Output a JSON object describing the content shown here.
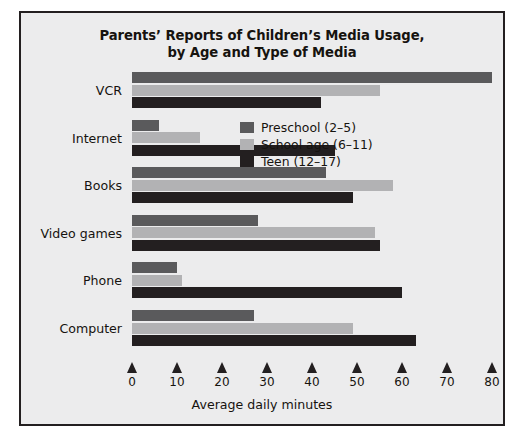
{
  "chart_data": {
    "type": "bar",
    "orientation": "horizontal",
    "title": "Parents’ Reports of Children’s Media Usage,\nby Age and Type of Media",
    "title_line1": "Parents’ Reports of Children’s Media Usage,",
    "title_line2": "by Age and Type of Media",
    "xlabel": "Average daily minutes",
    "ylabel": "",
    "categories": [
      "VCR",
      "Internet",
      "Books",
      "Video games",
      "Phone",
      "Computer"
    ],
    "series": [
      {
        "name": "Preschool (2–5)",
        "color": "#5a5a5c",
        "values": [
          80,
          6,
          43,
          28,
          10,
          27
        ]
      },
      {
        "name": "School age (6–11)",
        "color": "#b2b2b4",
        "values": [
          55,
          15,
          58,
          54,
          11,
          49
        ]
      },
      {
        "name": "Teen (12–17)",
        "color": "#231f20",
        "values": [
          42,
          45,
          49,
          55,
          60,
          63
        ]
      }
    ],
    "xlim": [
      0,
      80
    ],
    "xticks": [
      0,
      10,
      20,
      30,
      40,
      50,
      60,
      70,
      80
    ],
    "xtick_labels": [
      "0",
      "10",
      "20",
      "30",
      "40",
      "50",
      "60",
      "70",
      "80"
    ],
    "grid": false,
    "legend_position": "upper right"
  },
  "figure": {
    "background_color": "#ececed",
    "border_color": "#231f20",
    "text_color": "#16130f"
  }
}
